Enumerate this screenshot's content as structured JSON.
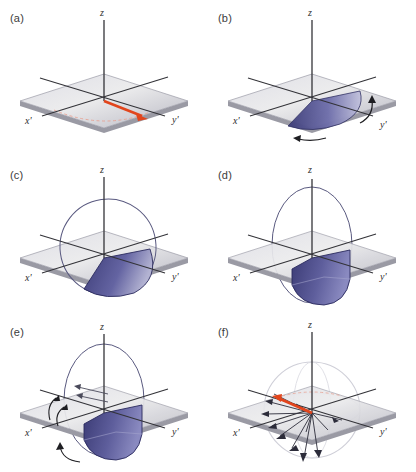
{
  "figure": {
    "columns": 2,
    "rows": 3,
    "background": "#ffffff"
  },
  "colors": {
    "plane_top_light": "#e9e9ee",
    "plane_top_dark": "#b9b9c4",
    "plane_edge": "#8e8e98",
    "plane_side": "#9a9aa4",
    "axis": "#333338",
    "axis_light": "#555560",
    "cone_dark": "#3c3c78",
    "cone_mid": "#5a5a96",
    "cone_light": "#a9a9cc",
    "cone_outline": "#2a2a5e",
    "ellipse_outline": "#5a5a80",
    "sphere_outline": "#cfcfd8",
    "vector_red": "#e2451c",
    "arrow_black": "#1e1e22",
    "label_text": "#3b3b3b",
    "dashed_red": "#e8a090"
  },
  "panels": [
    {
      "id": "a",
      "label": "(a)",
      "axes": {
        "z": "z",
        "x": "x'",
        "y": "y'"
      },
      "description": "Equilibrium magnetization vector lying in the transverse plane pointing along y'",
      "has_plane": true,
      "has_cone": false,
      "has_ellipse": false,
      "has_sphere": false,
      "red_vector": {
        "present": true,
        "direction": "toward y'"
      },
      "dashed_arc": {
        "present": true,
        "color": "#e8a090"
      },
      "curved_arrows": 0,
      "fan_vectors": 0
    },
    {
      "id": "b",
      "label": "(b)",
      "axes": {
        "z": "z",
        "x": "x'",
        "y": "y'"
      },
      "description": "Magnetization fanning out within the transverse plane, rotation indicated by curved arrows",
      "has_plane": true,
      "has_cone": true,
      "cone_extent": "in-plane fan",
      "has_ellipse": false,
      "has_sphere": false,
      "red_vector": {
        "present": false,
        "direction": ""
      },
      "dashed_arc": {
        "present": false,
        "color": ""
      },
      "curved_arrows": 2,
      "fan_vectors": 0
    },
    {
      "id": "c",
      "label": "(c)",
      "axes": {
        "z": "z",
        "x": "x'",
        "y": "y'"
      },
      "description": "Swept cone tipping below the transverse plane with circular trajectory outline",
      "has_plane": true,
      "has_cone": true,
      "cone_extent": "partly below plane",
      "has_ellipse": true,
      "ellipse_orientation": "tilted circle",
      "has_sphere": false,
      "red_vector": {
        "present": false,
        "direction": ""
      },
      "dashed_arc": {
        "present": false,
        "color": ""
      },
      "curved_arrows": 0,
      "fan_vectors": 0
    },
    {
      "id": "d",
      "label": "(d)",
      "axes": {
        "z": "z",
        "x": "x'",
        "y": "y'"
      },
      "description": "Magnetization swept into a full lobe below the plane, vertical circular trajectory",
      "has_plane": true,
      "has_cone": true,
      "cone_extent": "fully below plane",
      "has_ellipse": true,
      "ellipse_orientation": "vertical",
      "has_sphere": false,
      "red_vector": {
        "present": false,
        "direction": ""
      },
      "dashed_arc": {
        "present": false,
        "color": ""
      },
      "curved_arrows": 0,
      "fan_vectors": 0
    },
    {
      "id": "e",
      "label": "(e)",
      "axes": {
        "z": "z",
        "x": "x'",
        "y": "y'"
      },
      "description": "Same lobe as (d) with additional rotation arrows indicating precession sense",
      "has_plane": true,
      "has_cone": true,
      "cone_extent": "fully below plane",
      "has_ellipse": true,
      "ellipse_orientation": "vertical",
      "has_sphere": false,
      "red_vector": {
        "present": false,
        "direction": ""
      },
      "dashed_arc": {
        "present": false,
        "color": ""
      },
      "curved_arrows": 4,
      "fan_vectors": 0
    },
    {
      "id": "f",
      "label": "(f)",
      "axes": {
        "z": "z",
        "x": "x'",
        "y": "y'"
      },
      "description": "Isotropic distribution of individual spin vectors within a faint sphere, net vector in red",
      "has_plane": true,
      "has_cone": false,
      "has_ellipse": false,
      "has_sphere": true,
      "red_vector": {
        "present": true,
        "direction": "toward x'"
      },
      "dashed_arc": {
        "present": true,
        "color": "#e8a090"
      },
      "curved_arrows": 0,
      "fan_vectors": 12
    }
  ]
}
